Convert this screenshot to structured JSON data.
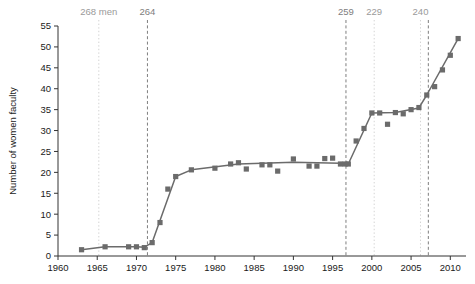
{
  "chart_data": {
    "type": "scatter",
    "title": "",
    "xlabel": "",
    "ylabel": "Number of women faculty",
    "xlim": [
      1960,
      2012
    ],
    "ylim": [
      0,
      56
    ],
    "xticks": [
      1960,
      1965,
      1970,
      1975,
      1980,
      1985,
      1990,
      1995,
      2000,
      2005,
      2010
    ],
    "yticks": [
      0,
      5,
      10,
      15,
      20,
      25,
      30,
      35,
      40,
      45,
      50,
      55
    ],
    "grid": false,
    "legend": "none",
    "marker": "square",
    "series": [
      {
        "name": "Number of women faculty",
        "color": "#6b6b6b",
        "points": [
          {
            "x": 1963,
            "y": 1.5
          },
          {
            "x": 1966,
            "y": 2.2
          },
          {
            "x": 1969,
            "y": 2.2
          },
          {
            "x": 1970,
            "y": 2.2
          },
          {
            "x": 1971,
            "y": 2.0
          },
          {
            "x": 1972,
            "y": 3.2
          },
          {
            "x": 1973,
            "y": 8.0
          },
          {
            "x": 1974,
            "y": 16.0
          },
          {
            "x": 1975,
            "y": 19.0
          },
          {
            "x": 1977,
            "y": 20.6
          },
          {
            "x": 1980,
            "y": 21.0
          },
          {
            "x": 1982,
            "y": 22.0
          },
          {
            "x": 1983,
            "y": 22.3
          },
          {
            "x": 1984,
            "y": 20.8
          },
          {
            "x": 1986,
            "y": 21.8
          },
          {
            "x": 1987,
            "y": 21.8
          },
          {
            "x": 1988,
            "y": 20.3
          },
          {
            "x": 1990,
            "y": 23.2
          },
          {
            "x": 1992,
            "y": 21.5
          },
          {
            "x": 1993,
            "y": 21.5
          },
          {
            "x": 1994,
            "y": 23.3
          },
          {
            "x": 1995,
            "y": 23.4
          },
          {
            "x": 1996,
            "y": 22.0
          },
          {
            "x": 1996.6,
            "y": 22.0
          },
          {
            "x": 1997,
            "y": 22.0
          },
          {
            "x": 1998,
            "y": 27.5
          },
          {
            "x": 1999,
            "y": 30.5
          },
          {
            "x": 2000,
            "y": 34.2
          },
          {
            "x": 2001,
            "y": 34.2
          },
          {
            "x": 2002,
            "y": 31.5
          },
          {
            "x": 2003,
            "y": 34.3
          },
          {
            "x": 2004,
            "y": 34.0
          },
          {
            "x": 2005,
            "y": 35.0
          },
          {
            "x": 2006,
            "y": 35.5
          },
          {
            "x": 2007,
            "y": 38.5
          },
          {
            "x": 2008,
            "y": 40.5
          },
          {
            "x": 2009,
            "y": 44.5
          },
          {
            "x": 2010,
            "y": 48.0
          },
          {
            "x": 2011,
            "y": 52.0
          }
        ],
        "line": [
          {
            "x": 1963,
            "y": 1.5
          },
          {
            "x": 1966,
            "y": 2.2
          },
          {
            "x": 1970,
            "y": 2.2
          },
          {
            "x": 1971,
            "y": 2.1
          },
          {
            "x": 1972,
            "y": 3.2
          },
          {
            "x": 1975,
            "y": 19.0
          },
          {
            "x": 1977,
            "y": 20.6
          },
          {
            "x": 1983,
            "y": 22.0
          },
          {
            "x": 1990,
            "y": 22.4
          },
          {
            "x": 1996,
            "y": 22.2
          },
          {
            "x": 1997,
            "y": 22.0
          },
          {
            "x": 2000,
            "y": 34.2
          },
          {
            "x": 2003,
            "y": 34.3
          },
          {
            "x": 2006,
            "y": 35.4
          },
          {
            "x": 2007,
            "y": 38.5
          },
          {
            "x": 2011,
            "y": 52.0
          }
        ]
      }
    ],
    "annotations": [
      {
        "label": "268 men",
        "x": 1965.2,
        "style": "light"
      },
      {
        "label": "264",
        "x": 1971.4,
        "style": "dark"
      },
      {
        "label": "259",
        "x": 1996.7,
        "style": "dark"
      },
      {
        "label": "229",
        "x": 2000.3,
        "style": "light"
      },
      {
        "label": "240",
        "x": 2006.2,
        "style": "light"
      },
      {
        "label": "",
        "x": 2007.2,
        "style": "dark"
      }
    ]
  }
}
